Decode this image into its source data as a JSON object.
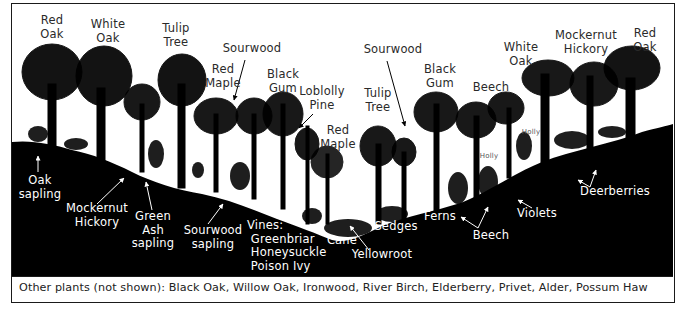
{
  "diagram": {
    "colors": {
      "ink": "#000000",
      "label_dark": "#2a2a2a",
      "label_light": "#ffffff",
      "background": "#ffffff",
      "frame": "#1a1a1a"
    },
    "canopy_labels": [
      {
        "id": "red-oak-left",
        "text": "Red\nOak",
        "x": 40,
        "y": 12
      },
      {
        "id": "white-oak-left",
        "text": "White\nOak",
        "x": 88,
        "y": 16
      },
      {
        "id": "tulip-tree-left",
        "text": "Tulip\nTree",
        "x": 161,
        "y": 20
      },
      {
        "id": "red-maple-left",
        "text": "Red\nMaple",
        "x": 204,
        "y": 61
      },
      {
        "id": "sourwood-left",
        "text": "Sourwood",
        "x": 231,
        "y": 40
      },
      {
        "id": "black-gum-left",
        "text": "Black\nGum",
        "x": 264,
        "y": 66
      },
      {
        "id": "loblolly-pine",
        "text": "Loblolly\nPine",
        "x": 302,
        "y": 83
      },
      {
        "id": "red-maple-center",
        "text": "Red\nMaple",
        "x": 317,
        "y": 122
      },
      {
        "id": "tulip-tree-center",
        "text": "Tulip\nTree",
        "x": 358,
        "y": 85
      },
      {
        "id": "sourwood-right",
        "text": "Sourwood",
        "x": 360,
        "y": 41
      },
      {
        "id": "black-gum-right",
        "text": "Black\nGum",
        "x": 418,
        "y": 61
      },
      {
        "id": "beech-upper",
        "text": "Beech",
        "x": 471,
        "y": 79
      },
      {
        "id": "white-oak-right",
        "text": "White\nOak",
        "x": 501,
        "y": 39
      },
      {
        "id": "mockernut-hickory-upper",
        "text": "Mockernut\nHickory",
        "x": 552,
        "y": 27
      },
      {
        "id": "red-oak-right",
        "text": "Red\nOak",
        "x": 624,
        "y": 25
      },
      {
        "id": "holly-1",
        "text": "Holly",
        "x": 516,
        "y": 126,
        "small": true
      },
      {
        "id": "holly-2",
        "text": "Holly",
        "x": 474,
        "y": 150,
        "small": true
      }
    ],
    "ground_labels": [
      {
        "id": "oak-sapling",
        "text": "Oak\nsapling",
        "x": 26,
        "y": 172
      },
      {
        "id": "mockernut-hickory-lower",
        "text": "Mockernut\nHickory",
        "x": 66,
        "y": 200
      },
      {
        "id": "green-ash-sapling",
        "text": "Green\nAsh\nsapling",
        "x": 130,
        "y": 208
      },
      {
        "id": "sourwood-sapling",
        "text": "Sourwood\nsapling",
        "x": 180,
        "y": 222
      },
      {
        "id": "vines",
        "text": "Vines:\n Greenbriar\n Honeysuckle\n Poison Ivy",
        "x": 243,
        "y": 217
      },
      {
        "id": "cane",
        "text": "Cane",
        "x": 323,
        "y": 232
      },
      {
        "id": "sedges",
        "text": "Sedges",
        "x": 372,
        "y": 218
      },
      {
        "id": "yellowroot",
        "text": "Yellowroot",
        "x": 348,
        "y": 246
      },
      {
        "id": "ferns",
        "text": "Ferns",
        "x": 420,
        "y": 208
      },
      {
        "id": "beech-lower",
        "text": "Beech",
        "x": 469,
        "y": 227
      },
      {
        "id": "violets",
        "text": "Violets",
        "x": 512,
        "y": 205
      },
      {
        "id": "deerberries",
        "text": "Deerberries",
        "x": 578,
        "y": 183
      }
    ],
    "caption": "Other plants (not shown): Black Oak, Willow Oak, Ironwood, River Birch, Elderberry, Privet, Alder, Possum Haw"
  }
}
